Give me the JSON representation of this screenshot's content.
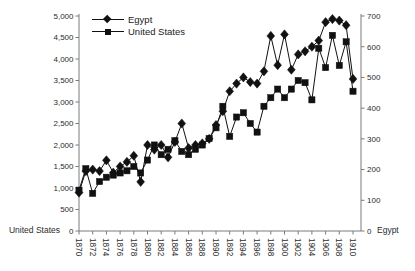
{
  "chart_data": {
    "type": "line",
    "x": [
      1870,
      1871,
      1872,
      1873,
      1874,
      1875,
      1876,
      1877,
      1878,
      1879,
      1880,
      1881,
      1882,
      1883,
      1884,
      1885,
      1886,
      1887,
      1888,
      1889,
      1890,
      1891,
      1892,
      1893,
      1894,
      1895,
      1896,
      1897,
      1898,
      1899,
      1900,
      1901,
      1902,
      1903,
      1904,
      1905,
      1906,
      1907,
      1908,
      1909,
      1910
    ],
    "series": [
      {
        "name": "Egypt",
        "axis": "right",
        "marker": "diamond",
        "values": [
          125,
          195,
          200,
          195,
          230,
          190,
          210,
          225,
          245,
          160,
          280,
          265,
          280,
          240,
          290,
          350,
          270,
          280,
          285,
          300,
          345,
          390,
          455,
          480,
          500,
          485,
          480,
          520,
          635,
          540,
          640,
          525,
          575,
          585,
          600,
          620,
          680,
          690,
          685,
          670,
          495
        ]
      },
      {
        "name": "United States",
        "axis": "left",
        "marker": "square",
        "values": [
          950,
          1450,
          875,
          1150,
          1250,
          1300,
          1350,
          1400,
          1500,
          1350,
          1650,
          2000,
          1775,
          1900,
          2100,
          1850,
          1775,
          1900,
          2000,
          2150,
          2400,
          2900,
          2200,
          2650,
          2750,
          2500,
          2300,
          2900,
          3100,
          3300,
          3100,
          3300,
          3500,
          3450,
          3050,
          4250,
          3800,
          4550,
          3850,
          4400,
          3250
        ]
      }
    ],
    "left_axis": {
      "label": "United States",
      "min": 0,
      "max": 5000,
      "tick_step": 500,
      "tick_values": [
        0,
        500,
        1000,
        1500,
        2000,
        2500,
        3000,
        3500,
        4000,
        4500,
        5000
      ],
      "tick_labels": [
        "0",
        "500",
        "1,000",
        "1,500",
        "2,000",
        "2,500",
        "3,000",
        "3,500",
        "4,000",
        "4,500",
        "5,000"
      ]
    },
    "right_axis": {
      "label": "Egypt",
      "min": 0,
      "max": 700,
      "tick_step": 100,
      "tick_values": [
        0,
        100,
        200,
        300,
        400,
        500,
        600,
        700
      ],
      "tick_labels": [
        "0",
        "100",
        "200",
        "300",
        "400",
        "500",
        "600",
        "700"
      ]
    },
    "x_axis": {
      "tick_years": [
        1870,
        1872,
        1874,
        1876,
        1878,
        1880,
        1882,
        1884,
        1886,
        1888,
        1890,
        1892,
        1894,
        1896,
        1898,
        1900,
        1902,
        1904,
        1906,
        1908,
        1910
      ],
      "tick_labels": [
        "1870",
        "1872",
        "1874",
        "1876",
        "1878",
        "1880",
        "1882",
        "1884",
        "1886",
        "1888",
        "1890",
        "1892",
        "1894",
        "1896",
        "1898",
        "1900",
        "1902",
        "1904",
        "1906",
        "1908",
        "1910"
      ],
      "label_rotation": 90
    },
    "legend": {
      "position": "top-left",
      "entries": [
        "Egypt",
        "United States"
      ]
    },
    "grid": false,
    "colors": {
      "series": "#111111",
      "axis_line": "#7a7a7a",
      "tick_text": "#2b2b2b"
    }
  }
}
